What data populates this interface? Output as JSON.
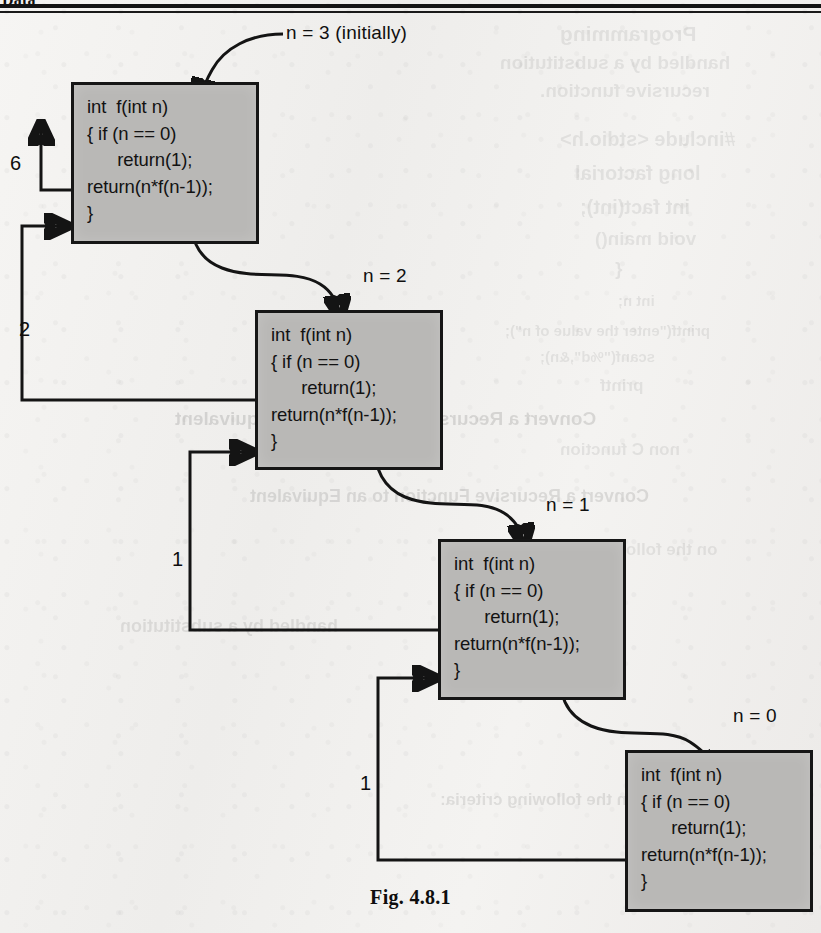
{
  "page": {
    "header_partial_text": "Data",
    "caption": "Fig. 4.8.1"
  },
  "diagram": {
    "code_body": "int  f(int n)\n{ if (n == 0)\n      return(1);\nreturn(n*f(n-1));\n}",
    "frames": [
      {
        "id": "frame-n3",
        "call_label": "n = 3 (initially)",
        "code": "int  f(int n)\n{ if (n == 0)\n      return(1);\nreturn(n*f(n-1));\n}",
        "returns": "6"
      },
      {
        "id": "frame-n2",
        "call_label": "n = 2",
        "code": "int  f(int n)\n{ if (n == 0)\n      return(1);\nreturn(n*f(n-1));\n}",
        "returns": "2"
      },
      {
        "id": "frame-n1",
        "call_label": "n = 1",
        "code": "int  f(int n)\n{ if (n == 0)\n      return(1);\nreturn(n*f(n-1));\n}",
        "returns": "1"
      },
      {
        "id": "frame-n0",
        "call_label": "n = 0",
        "code": "int  f(int n)\n{ if (n == 0)\n      return(1);\nreturn(n*f(n-1));\n}",
        "returns": "1"
      }
    ],
    "return_values": {
      "final": "6",
      "from_n2_to_n3": "2",
      "from_n1_to_n2": "1",
      "from_n0_to_n1": "1"
    },
    "colors": {
      "frame_fill": "#b9b8b6",
      "frame_border": "#161616",
      "arrow": "#141414",
      "paper": "#f2f1ef",
      "text": "#121212"
    }
  },
  "ghost_text": {
    "lines": [
      "Programming",
      "handled by a substitution",
      "recursive function.",
      "#include <stdio.h>",
      "long factorial",
      "int fact(int);",
      "void main()",
      "{",
      "int n;",
      "printf(\"enter the value of n\");",
      "scanf(\"%d\",&n);",
      "printf",
      "Convert a Recursive Function to an Equivalent",
      "non C function",
      "on the following criteria:"
    ]
  }
}
